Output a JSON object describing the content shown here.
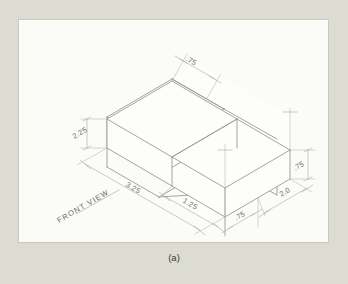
{
  "figure": {
    "caption": "(a)",
    "view_label": "FRONT VIEW",
    "panel_background": "#fbfbf7",
    "page_background": "#dcdcd2",
    "line_color": "#9a9a9a",
    "dimension_color": "#a8a8a8",
    "text_color": "#6b6b6b"
  },
  "dimensions": {
    "top_notch_width": ".75",
    "height_left": "2.25",
    "right_step_height": ".75",
    "overall_length": "3.25",
    "notch_length": "1.25",
    "notch_depth": ".75",
    "overall_depth": "2.0"
  },
  "drawing": {
    "type": "isometric-pictorial",
    "object": "L-shaped block with rectangular notch",
    "projection": "isometric 30 degree"
  }
}
